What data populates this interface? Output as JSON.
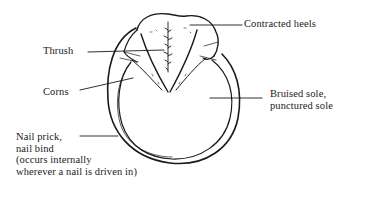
{
  "diagram": {
    "labels": {
      "contracted_heels": "Contracted heels",
      "thrush": "Thrush",
      "corns": "Corns",
      "bruised_sole": {
        "line1": "Bruised sole,",
        "line2": "punctured sole"
      },
      "nail_prick": {
        "line1": "Nail prick,",
        "line2": "nail bind",
        "line3": "(occurs internally",
        "line4": "wherever a nail is driven in)"
      }
    },
    "colors": {
      "ink": "#1a1a1a",
      "background": "#ffffff"
    }
  }
}
